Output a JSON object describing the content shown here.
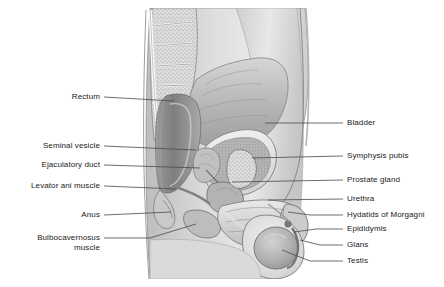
{
  "figure": {
    "view": "midsagittal",
    "style": "grayscale medical illustration",
    "colors": {
      "background": "#ffffff",
      "label_text": "#1a1a1a",
      "leader_line": "#4a4a4a",
      "outline": "#6e6e6e",
      "tissue_light": "#e6e6e6",
      "tissue_mid": "#c4c4c4",
      "tissue_dark": "#9a9a9a",
      "cavity_dark": "#8a8a8a",
      "bone_fill": "#dcdcdc",
      "white_fill": "#fbfbfb"
    }
  },
  "labels_left": [
    {
      "id": "rectum",
      "text": "Rectum",
      "x": 100,
      "y": 97,
      "tip_x": 174,
      "tip_y": 101
    },
    {
      "id": "seminal-vesicle",
      "text": "Seminal vesicle",
      "x": 100,
      "y": 146,
      "tip_x": 196,
      "tip_y": 150
    },
    {
      "id": "ejaculatory-duct",
      "text": "Ejaculatory duct",
      "x": 100,
      "y": 165,
      "tip_x": 200,
      "tip_y": 168
    },
    {
      "id": "levator-ani-muscle",
      "text": "Levator ani muscle",
      "x": 100,
      "y": 186,
      "tip_x": 176,
      "tip_y": 189
    },
    {
      "id": "anus",
      "text": "Anus",
      "x": 100,
      "y": 215,
      "tip_x": 171,
      "tip_y": 212
    },
    {
      "id": "bulbocavernosus-muscle",
      "text": "Bulbocavernosus\nmuscle",
      "x": 100,
      "y": 238,
      "tip_x": 196,
      "tip_y": 224
    }
  ],
  "labels_right": [
    {
      "id": "bladder",
      "text": "Bladder",
      "x": 347,
      "y": 123,
      "tip_x": 265,
      "tip_y": 123
    },
    {
      "id": "symphysis-pubis",
      "text": "Symphysis pubis",
      "x": 347,
      "y": 156,
      "tip_x": 252,
      "tip_y": 158
    },
    {
      "id": "prostate-gland",
      "text": "Prostate gland",
      "x": 347,
      "y": 180,
      "tip_x": 232,
      "tip_y": 182
    },
    {
      "id": "urethra",
      "text": "Urethra",
      "x": 347,
      "y": 199,
      "tip_x": 268,
      "tip_y": 200
    },
    {
      "id": "hydatids-of-morgagni",
      "text": "Hydatids of Morgagni",
      "x": 347,
      "y": 215,
      "tip_x": 288,
      "tip_y": 212
    },
    {
      "id": "epididymis",
      "text": "Epididymis",
      "x": 347,
      "y": 229,
      "tip_x": 292,
      "tip_y": 232
    },
    {
      "id": "glans",
      "text": "Glans",
      "x": 347,
      "y": 245,
      "tip_x": 300,
      "tip_y": 240
    },
    {
      "id": "testis",
      "text": "Testis",
      "x": 347,
      "y": 261,
      "tip_x": 282,
      "tip_y": 250
    }
  ]
}
